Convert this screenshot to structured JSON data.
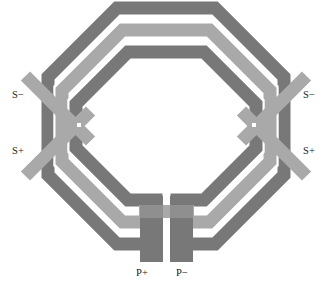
{
  "figure": {
    "kind": "diagram",
    "width": 333,
    "height": 292,
    "background": "#ffffff"
  },
  "palette": {
    "metal_dark": "#787878",
    "metal_light": "#a9a9a9",
    "metal_mid": "#8f8f8f",
    "overlap_dark": "#6a6a6a",
    "gap": "#ffffff",
    "label": "#1a1a1a"
  },
  "labels": {
    "s_minus_left": "S−",
    "s_plus_left": "S+",
    "s_minus_right": "S−",
    "s_plus_right": "S+",
    "p_plus": "P+",
    "p_minus": "P−"
  },
  "terminals": [
    {
      "name": "S−",
      "side": "left",
      "position": "upper",
      "trace": "secondary",
      "color": "#a9a9a9"
    },
    {
      "name": "S+",
      "side": "left",
      "position": "lower",
      "trace": "secondary",
      "color": "#a9a9a9"
    },
    {
      "name": "S−",
      "side": "right",
      "position": "upper",
      "trace": "secondary",
      "color": "#a9a9a9"
    },
    {
      "name": "S+",
      "side": "right",
      "position": "lower",
      "trace": "secondary",
      "color": "#a9a9a9"
    },
    {
      "name": "P+",
      "side": "bottom",
      "position": "left",
      "trace": "primary",
      "color": "#787878"
    },
    {
      "name": "P−",
      "side": "bottom",
      "position": "right",
      "trace": "primary",
      "color": "#787878"
    }
  ],
  "windings": {
    "count": 3,
    "shape": "octagon",
    "rings": [
      {
        "index": 0,
        "role": "outer",
        "fill": "#787878",
        "label": "primary-outer"
      },
      {
        "index": 1,
        "role": "middle",
        "fill": "#a9a9a9",
        "label": "secondary"
      },
      {
        "index": 2,
        "role": "inner",
        "fill": "#787878",
        "label": "primary-inner"
      }
    ],
    "gap_fill": "#ffffff"
  },
  "geometry": {
    "center_x": 166,
    "center_y": 126,
    "outer_radius": 118,
    "trace_width": 13,
    "trace_gap": 3,
    "bottom_lead_y": 262,
    "side_lead_angle_deg": 45
  }
}
